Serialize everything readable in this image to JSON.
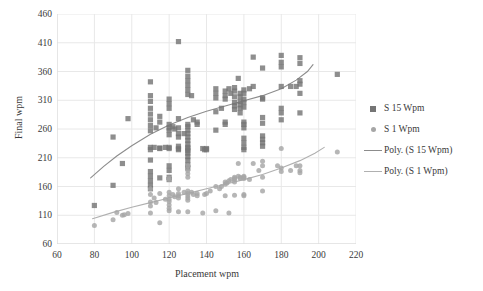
{
  "chart_data": {
    "type": "scatter",
    "title": "",
    "xlabel": "Placement wpm",
    "ylabel": "Final wpm",
    "xlim": [
      60,
      220
    ],
    "ylim": [
      60,
      460
    ],
    "xticks": [
      60,
      80,
      100,
      120,
      140,
      160,
      180,
      200,
      220
    ],
    "yticks": [
      60,
      110,
      160,
      210,
      260,
      310,
      360,
      410,
      460
    ],
    "grid": true,
    "legend_position": "right",
    "colors": {
      "series_s15_marker": "#757575",
      "series_s1_marker": "#a6a6a6",
      "trend_s15_line": "#8c8c8c",
      "trend_s1_line": "#b0b0b0",
      "gridline": "#e8e8e8",
      "axis": "#d9d9d9",
      "text": "#3a3a3a",
      "background": "#ffffff"
    },
    "series": [
      {
        "name": "S 15 Wpm",
        "marker": "square",
        "color": "#757575",
        "points": [
          [
            80,
            127
          ],
          [
            90,
            246
          ],
          [
            90,
            162
          ],
          [
            95,
            200
          ],
          [
            98,
            278
          ],
          [
            110,
            342
          ],
          [
            110,
            318
          ],
          [
            110,
            308
          ],
          [
            110,
            296
          ],
          [
            110,
            286
          ],
          [
            110,
            276
          ],
          [
            110,
            266
          ],
          [
            110,
            257
          ],
          [
            110,
            228
          ],
          [
            110,
            224
          ],
          [
            110,
            206
          ],
          [
            110,
            186
          ],
          [
            110,
            178
          ],
          [
            110,
            170
          ],
          [
            110,
            162
          ],
          [
            110,
            156
          ],
          [
            112,
            228
          ],
          [
            113,
            262
          ],
          [
            115,
            282
          ],
          [
            115,
            272
          ],
          [
            115,
            227
          ],
          [
            115,
            226
          ],
          [
            115,
            175
          ],
          [
            118,
            228
          ],
          [
            120,
            312
          ],
          [
            120,
            304
          ],
          [
            120,
            296
          ],
          [
            120,
            268
          ],
          [
            120,
            262
          ],
          [
            120,
            258
          ],
          [
            120,
            250
          ],
          [
            120,
            228
          ],
          [
            120,
            226
          ],
          [
            120,
            196
          ],
          [
            120,
            188
          ],
          [
            120,
            176
          ],
          [
            120,
            172
          ],
          [
            122,
            264
          ],
          [
            123,
            260
          ],
          [
            125,
            412
          ],
          [
            125,
            278
          ],
          [
            125,
            262
          ],
          [
            125,
            252
          ],
          [
            125,
            246
          ],
          [
            125,
            230
          ],
          [
            125,
            226
          ],
          [
            125,
            224
          ],
          [
            128,
            252
          ],
          [
            130,
            362
          ],
          [
            130,
            352
          ],
          [
            130,
            344
          ],
          [
            130,
            336
          ],
          [
            130,
            328
          ],
          [
            130,
            320
          ],
          [
            130,
            268
          ],
          [
            130,
            264
          ],
          [
            130,
            258
          ],
          [
            130,
            252
          ],
          [
            130,
            246
          ],
          [
            130,
            240
          ],
          [
            130,
            234
          ],
          [
            130,
            228
          ],
          [
            130,
            226
          ],
          [
            130,
            222
          ],
          [
            130,
            218
          ],
          [
            130,
            212
          ],
          [
            130,
            206
          ],
          [
            130,
            198
          ],
          [
            130,
            192
          ],
          [
            132,
            318
          ],
          [
            133,
            276
          ],
          [
            135,
            272
          ],
          [
            135,
            268
          ],
          [
            138,
            226
          ],
          [
            139,
            224
          ],
          [
            140,
            226
          ],
          [
            140,
            224
          ],
          [
            145,
            330
          ],
          [
            145,
            322
          ],
          [
            145,
            314
          ],
          [
            145,
            290
          ],
          [
            145,
            258
          ],
          [
            148,
            296
          ],
          [
            150,
            326
          ],
          [
            150,
            318
          ],
          [
            150,
            312
          ],
          [
            150,
            272
          ],
          [
            150,
            268
          ],
          [
            152,
            330
          ],
          [
            153,
            322
          ],
          [
            155,
            332
          ],
          [
            155,
            326
          ],
          [
            155,
            316
          ],
          [
            155,
            306
          ],
          [
            155,
            300
          ],
          [
            155,
            294
          ],
          [
            157,
            348
          ],
          [
            158,
            322
          ],
          [
            158,
            316
          ],
          [
            158,
            308
          ],
          [
            158,
            302
          ],
          [
            158,
            296
          ],
          [
            158,
            288
          ],
          [
            160,
            328
          ],
          [
            160,
            322
          ],
          [
            160,
            312
          ],
          [
            160,
            306
          ],
          [
            160,
            298
          ],
          [
            160,
            272
          ],
          [
            160,
            268
          ],
          [
            160,
            262
          ],
          [
            160,
            244
          ],
          [
            160,
            236
          ],
          [
            160,
            228
          ],
          [
            160,
            224
          ],
          [
            163,
            330
          ],
          [
            165,
            385
          ],
          [
            165,
            334
          ],
          [
            170,
            366
          ],
          [
            170,
            314
          ],
          [
            170,
            312
          ],
          [
            170,
            280
          ],
          [
            170,
            270
          ],
          [
            170,
            248
          ],
          [
            170,
            242
          ],
          [
            170,
            236
          ],
          [
            170,
            230
          ],
          [
            180,
            388
          ],
          [
            180,
            376
          ],
          [
            180,
            368
          ],
          [
            180,
            296
          ],
          [
            180,
            288
          ],
          [
            180,
            276
          ],
          [
            180,
            334
          ],
          [
            185,
            334
          ],
          [
            188,
            334
          ],
          [
            190,
            384
          ],
          [
            190,
            374
          ],
          [
            190,
            344
          ],
          [
            190,
            338
          ],
          [
            190,
            322
          ],
          [
            190,
            288
          ],
          [
            210,
            355
          ]
        ]
      },
      {
        "name": "S 1 Wpm",
        "marker": "circle",
        "color": "#a6a6a6",
        "points": [
          [
            80,
            92
          ],
          [
            90,
            102
          ],
          [
            92,
            115
          ],
          [
            95,
            110
          ],
          [
            96,
            111
          ],
          [
            98,
            113
          ],
          [
            110,
            156
          ],
          [
            110,
            146
          ],
          [
            110,
            133
          ],
          [
            110,
            126
          ],
          [
            110,
            114
          ],
          [
            112,
            140
          ],
          [
            113,
            132
          ],
          [
            115,
            97
          ],
          [
            115,
            148
          ],
          [
            118,
            138
          ],
          [
            120,
            175
          ],
          [
            120,
            172
          ],
          [
            120,
            150
          ],
          [
            120,
            144
          ],
          [
            120,
            138
          ],
          [
            120,
            134
          ],
          [
            120,
            128
          ],
          [
            120,
            122
          ],
          [
            120,
            118
          ],
          [
            122,
            146
          ],
          [
            123,
            142
          ],
          [
            125,
            156
          ],
          [
            125,
            148
          ],
          [
            125,
            144
          ],
          [
            125,
            140
          ],
          [
            125,
            116
          ],
          [
            128,
            150
          ],
          [
            130,
            196
          ],
          [
            130,
            188
          ],
          [
            130,
            182
          ],
          [
            130,
            176
          ],
          [
            130,
            152
          ],
          [
            130,
            148
          ],
          [
            130,
            144
          ],
          [
            130,
            140
          ],
          [
            130,
            136
          ],
          [
            130,
            116
          ],
          [
            132,
            150
          ],
          [
            133,
            146
          ],
          [
            135,
            148
          ],
          [
            135,
            144
          ],
          [
            138,
            114
          ],
          [
            139,
            146
          ],
          [
            140,
            148
          ],
          [
            142,
            152
          ],
          [
            145,
            160
          ],
          [
            145,
            118
          ],
          [
            147,
            156
          ],
          [
            148,
            160
          ],
          [
            150,
            168
          ],
          [
            150,
            164
          ],
          [
            150,
            144
          ],
          [
            151,
            166
          ],
          [
            152,
            170
          ],
          [
            152,
            114
          ],
          [
            153,
            172
          ],
          [
            155,
            176
          ],
          [
            155,
            174
          ],
          [
            155,
            172
          ],
          [
            155,
            168
          ],
          [
            155,
            145
          ],
          [
            157,
            200
          ],
          [
            157,
            178
          ],
          [
            158,
            176
          ],
          [
            158,
            174
          ],
          [
            160,
            178
          ],
          [
            160,
            176
          ],
          [
            160,
            174
          ],
          [
            160,
            146
          ],
          [
            160,
            144
          ],
          [
            163,
            172
          ],
          [
            165,
            200
          ],
          [
            168,
            188
          ],
          [
            170,
            204
          ],
          [
            170,
            196
          ],
          [
            170,
            176
          ],
          [
            170,
            152
          ],
          [
            178,
            196
          ],
          [
            180,
            226
          ],
          [
            180,
            192
          ],
          [
            180,
            186
          ],
          [
            185,
            188
          ],
          [
            188,
            196
          ],
          [
            190,
            196
          ],
          [
            190,
            188
          ],
          [
            190,
            184
          ],
          [
            210,
            220
          ]
        ]
      }
    ],
    "trendlines": [
      {
        "name": "Poly. (S 15 Wpm)",
        "color": "#8c8c8c",
        "path": [
          [
            78,
            175
          ],
          [
            85,
            195
          ],
          [
            92,
            213
          ],
          [
            100,
            231
          ],
          [
            110,
            251
          ],
          [
            120,
            267
          ],
          [
            130,
            280
          ],
          [
            140,
            291
          ],
          [
            150,
            300
          ],
          [
            160,
            309
          ],
          [
            170,
            318
          ],
          [
            180,
            330
          ],
          [
            188,
            345
          ],
          [
            194,
            360
          ],
          [
            197,
            372
          ]
        ]
      },
      {
        "name": "Poly. (S 1 Wpm)",
        "color": "#b0b0b0",
        "path": [
          [
            79,
            104
          ],
          [
            90,
            115
          ],
          [
            100,
            124
          ],
          [
            110,
            132
          ],
          [
            120,
            140
          ],
          [
            130,
            148
          ],
          [
            140,
            156
          ],
          [
            150,
            164
          ],
          [
            160,
            172
          ],
          [
            170,
            181
          ],
          [
            180,
            192
          ],
          [
            190,
            205
          ],
          [
            198,
            218
          ],
          [
            203,
            228
          ]
        ]
      }
    ]
  },
  "axes": {
    "y_title": "Final wpm",
    "x_title": "Placement wpm",
    "y_tick_labels": [
      "460",
      "410",
      "360",
      "310",
      "260",
      "210",
      "160",
      "110",
      "60"
    ],
    "x_tick_labels": [
      "60",
      "80",
      "100",
      "120",
      "140",
      "160",
      "180",
      "200",
      "220"
    ]
  },
  "legend": {
    "items": [
      {
        "label": "S 15 Wpm",
        "key": "square-marker-icon"
      },
      {
        "label": "S 1 Wpm",
        "key": "circle-marker-icon"
      },
      {
        "label": "Poly. (S 15 Wpm)",
        "key": "line-swatch-icon"
      },
      {
        "label": "Poly. (S 1 Wpm)",
        "key": "line-swatch-icon"
      }
    ]
  }
}
